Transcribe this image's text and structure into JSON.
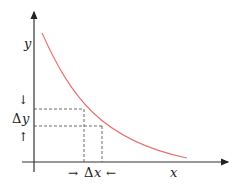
{
  "diagram": {
    "title": "",
    "axes": {
      "x_label": "x",
      "y_label": "y"
    },
    "annotations": {
      "delta_x": {
        "left_arrow": "→",
        "symbol": "Δ",
        "var": "x",
        "right_arrow": "←"
      },
      "delta_y": {
        "top_arrow": "↓",
        "symbol": "Δ",
        "var": "y",
        "bottom_arrow": "↑"
      }
    },
    "curve": {
      "type": "decreasing convex",
      "color": "#e8706a"
    },
    "axis_color": "#333333",
    "dash_color": "#444444"
  }
}
